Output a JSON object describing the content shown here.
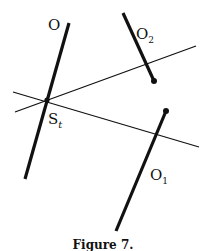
{
  "figure": {
    "caption": "Figure 7.",
    "labels": {
      "O": "O",
      "O2": "O",
      "O2_sub": "2",
      "O1": "O",
      "O1_sub": "1",
      "St": "S",
      "St_sub": "t"
    },
    "colors": {
      "stroke": "#111111",
      "background": "#ffffff"
    },
    "elements": [
      {
        "id": "segment-O",
        "type": "thick-segment",
        "from": [
          69,
          23
        ],
        "to": [
          25,
          179
        ]
      },
      {
        "id": "segment-O2",
        "type": "thick-segment-with-endpoint",
        "from": [
          123,
          13
        ],
        "to": [
          154,
          81
        ]
      },
      {
        "id": "segment-O1",
        "type": "thick-segment-with-endpoint",
        "from": [
          166,
          111
        ],
        "to": [
          116,
          231
        ]
      },
      {
        "id": "line-upper",
        "type": "thin-line",
        "from": [
          15,
          112
        ],
        "to": [
          196,
          46
        ]
      },
      {
        "id": "line-lower",
        "type": "thin-line",
        "from": [
          13,
          92
        ],
        "to": [
          199,
          147
        ]
      },
      {
        "id": "point-St",
        "type": "intersection",
        "at": [
          47,
          100
        ]
      }
    ]
  }
}
